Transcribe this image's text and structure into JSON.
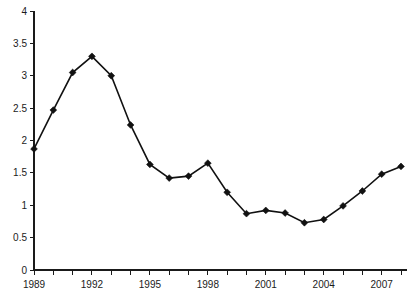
{
  "chart_data": {
    "type": "line",
    "title": "",
    "subtitle": "",
    "xlabel": "",
    "ylabel": "",
    "categories": [
      1989,
      1990,
      1991,
      1992,
      1993,
      1994,
      1995,
      1996,
      1997,
      1998,
      1999,
      2000,
      2001,
      2002,
      2003,
      2004,
      2005,
      2006,
      2007,
      2008
    ],
    "values": [
      1.87,
      2.47,
      3.05,
      3.3,
      3.0,
      2.24,
      1.63,
      1.42,
      1.45,
      1.65,
      1.2,
      0.87,
      0.92,
      0.88,
      0.73,
      0.78,
      0.99,
      1.22,
      1.48,
      1.6
    ],
    "series": [
      {
        "name": "series-1",
        "values": [
          1.87,
          2.47,
          3.05,
          3.3,
          3.0,
          2.24,
          1.63,
          1.42,
          1.45,
          1.65,
          1.2,
          0.87,
          0.92,
          0.88,
          0.73,
          0.78,
          0.99,
          1.22,
          1.48,
          1.6
        ]
      }
    ],
    "x_tick_labels": [
      "1989",
      "",
      "",
      "1992",
      "",
      "",
      "1995",
      "",
      "",
      "1998",
      "",
      "",
      "2001",
      "",
      "",
      "2004",
      "",
      "",
      "2007",
      ""
    ],
    "y_tick_labels": [
      "0",
      "0.5",
      "1",
      "1.5",
      "2",
      "2.5",
      "3",
      "3.5",
      "4"
    ],
    "y_ticks": [
      0,
      0.5,
      1,
      1.5,
      2,
      2.5,
      3,
      3.5,
      4
    ],
    "ylim": [
      0,
      4
    ],
    "xlim": [
      1989,
      2008
    ],
    "grid": false,
    "legend": false,
    "legend_position": "none",
    "marker": "diamond",
    "line_color": "#111111",
    "marker_color": "#111111",
    "axis_color": "#1a1a1a",
    "background_color": "#ffffff"
  }
}
